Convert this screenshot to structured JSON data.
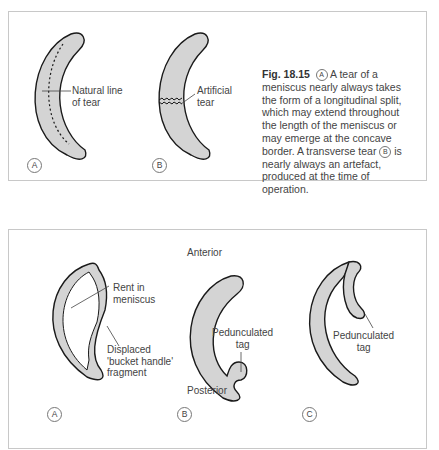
{
  "figure_top": {
    "panel_a": {
      "circle_label": "A",
      "label_line1": "Natural line",
      "label_line2": "of tear"
    },
    "panel_b": {
      "circle_label": "B",
      "label_line1": "Artificial",
      "label_line2": "tear"
    },
    "caption": {
      "fig_number": "Fig. 18.15",
      "marker_a": "A",
      "text_part1": " A tear of a meniscus nearly always takes the form of a longitudinal split, which may extend throughout the length of the meniscus or may emerge at the concave border. A transverse tear ",
      "marker_b": "B",
      "text_part2": " is nearly always an artefact, produced at the time of operation."
    }
  },
  "figure_bottom": {
    "panel_a": {
      "circle_label": "A",
      "rent_line1": "Rent in",
      "rent_line2": "meniscus",
      "frag_line1": "Displaced",
      "frag_line2": "'bucket handle'",
      "frag_line3": "fragment"
    },
    "panel_b": {
      "circle_label": "B",
      "anterior": "Anterior",
      "posterior": "Posterior",
      "tag_line1": "Pedunculated",
      "tag_line2": "tag"
    },
    "panel_c": {
      "circle_label": "C",
      "tag_line1": "Pedunculated",
      "tag_line2": "tag"
    }
  },
  "colors": {
    "fill": "#d4d4d4",
    "stroke": "#1a1a1a",
    "border": "#c8c8c8"
  }
}
